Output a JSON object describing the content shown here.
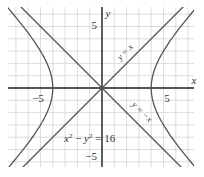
{
  "chart_data": {
    "type": "line",
    "title": "",
    "xlabel": "x",
    "ylabel": "y",
    "xlim": [
      -7.6,
      7.4
    ],
    "ylim": [
      -6.5,
      6.6
    ],
    "grid": true,
    "grid_step": 1,
    "x_ticks": [
      {
        "value": -5,
        "label": "−5"
      },
      {
        "value": 5,
        "label": "5"
      }
    ],
    "y_ticks": [
      {
        "value": 5,
        "label": "5"
      },
      {
        "value": -5,
        "label": "−5"
      }
    ],
    "series": [
      {
        "name": "x^2 - y^2 = 16",
        "kind": "hyperbola",
        "a": 4,
        "b": 4,
        "vertices": [
          [
            -4,
            0
          ],
          [
            4,
            0
          ]
        ]
      },
      {
        "name": "y = x",
        "kind": "asymptote",
        "slope": 1
      },
      {
        "name": "y = -x",
        "kind": "asymptote",
        "slope": -1
      }
    ],
    "annotations": [
      {
        "text": "y = x",
        "position": [
          4.3,
          2.8
        ],
        "rotation": -45
      },
      {
        "text": "y = −x",
        "position": [
          4.3,
          -2.7
        ],
        "rotation": 45
      },
      {
        "text": "x² − y² = 16",
        "position": [
          -1.7,
          -4.1
        ]
      }
    ],
    "colors": {
      "curve": "#555555",
      "axis": "#222222",
      "grid": "#d4d4d4",
      "text": "#555555"
    }
  },
  "labels": {
    "x_axis": "x",
    "y_axis": "y",
    "x_tick_neg5": "−5",
    "x_tick_pos5": "5",
    "y_tick_pos5": "5",
    "y_tick_neg5": "−5",
    "asymptote_pos": "y = x",
    "asymptote_neg": "y = −x",
    "equation_x": "x",
    "equation_sup1": "2",
    "equation_minus": " − ",
    "equation_y": "y",
    "equation_sup2": "2",
    "equation_rhs": " = 16"
  }
}
